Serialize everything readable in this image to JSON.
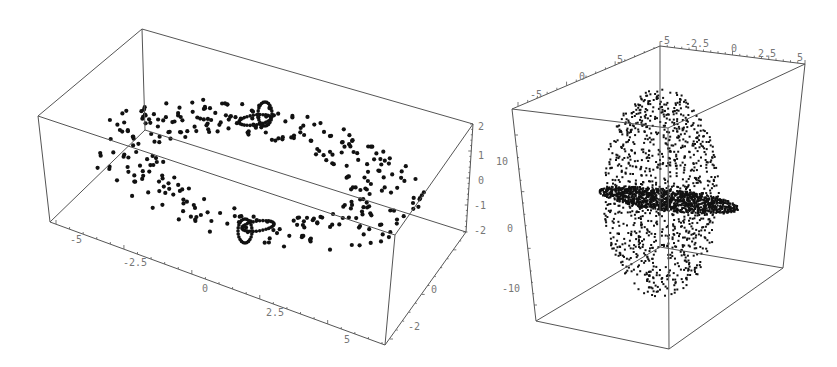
{
  "chart_data": [
    {
      "type": "scatter",
      "subtype": "3d-point-cloud",
      "title": "",
      "description": "Flattened ellipsoidal ring of points with two small tight loops (above and below) near the center",
      "axes": {
        "x": {
          "ticks": [
            "-5",
            "-2.5",
            "0",
            "2.5",
            "5"
          ],
          "range": [
            -6,
            6
          ]
        },
        "y": {
          "ticks": [
            "-2",
            "0",
            "2"
          ],
          "range": [
            -3,
            3
          ]
        },
        "z": {
          "ticks": [
            "2",
            "1",
            "0",
            "-1",
            "-2"
          ],
          "range": [
            -2,
            2
          ]
        }
      },
      "box": true,
      "grid": false
    },
    {
      "type": "scatter",
      "subtype": "3d-point-cloud",
      "title": "",
      "description": "Vertical ellipsoidal cloud of points with dense horizontal disk at center",
      "axes": {
        "x": {
          "ticks": [
            "-5",
            "-2.5",
            "0",
            "2.5",
            "5"
          ],
          "range": [
            -5,
            5
          ]
        },
        "y": {
          "ticks": [
            "-5",
            "0",
            "5"
          ],
          "range": [
            -7,
            7
          ]
        },
        "z": {
          "ticks": [
            "10",
            "0",
            "-10"
          ],
          "range": [
            -15,
            15
          ]
        }
      },
      "box": true,
      "grid": false
    }
  ],
  "left": {
    "x_ticks": [
      {
        "label": "-5",
        "x": 70,
        "y": 243
      },
      {
        "label": "-2.5",
        "x": 123,
        "y": 266
      },
      {
        "label": "0",
        "x": 202,
        "y": 292
      },
      {
        "label": "2.5",
        "x": 266,
        "y": 316
      },
      {
        "label": "5",
        "x": 344,
        "y": 343
      }
    ],
    "y_ticks": [
      {
        "label": "0",
        "x": 431,
        "y": 293
      },
      {
        "label": "-2",
        "x": 408,
        "y": 330
      }
    ],
    "z_ticks": [
      {
        "label": "2",
        "x": 478,
        "y": 130
      },
      {
        "label": "1",
        "x": 478,
        "y": 159
      },
      {
        "label": "0",
        "x": 478,
        "y": 184
      },
      {
        "label": "-1",
        "x": 474,
        "y": 209
      },
      {
        "label": "-2",
        "x": 474,
        "y": 234
      }
    ]
  },
  "right": {
    "x_ticks": [
      {
        "label": "-5",
        "x": 658,
        "y": 44
      },
      {
        "label": "-2.5",
        "x": 685,
        "y": 47
      },
      {
        "label": "0",
        "x": 731,
        "y": 52
      },
      {
        "label": "2.5",
        "x": 758,
        "y": 57
      },
      {
        "label": "5",
        "x": 797,
        "y": 61
      }
    ],
    "y_ticks": [
      {
        "label": "5",
        "x": 617,
        "y": 63
      },
      {
        "label": "0",
        "x": 579,
        "y": 80
      },
      {
        "label": "-5",
        "x": 530,
        "y": 98
      }
    ],
    "z_ticks": [
      {
        "label": "10",
        "x": 496,
        "y": 165
      },
      {
        "label": "0",
        "x": 507,
        "y": 232
      },
      {
        "label": "-10",
        "x": 502,
        "y": 292
      }
    ]
  }
}
